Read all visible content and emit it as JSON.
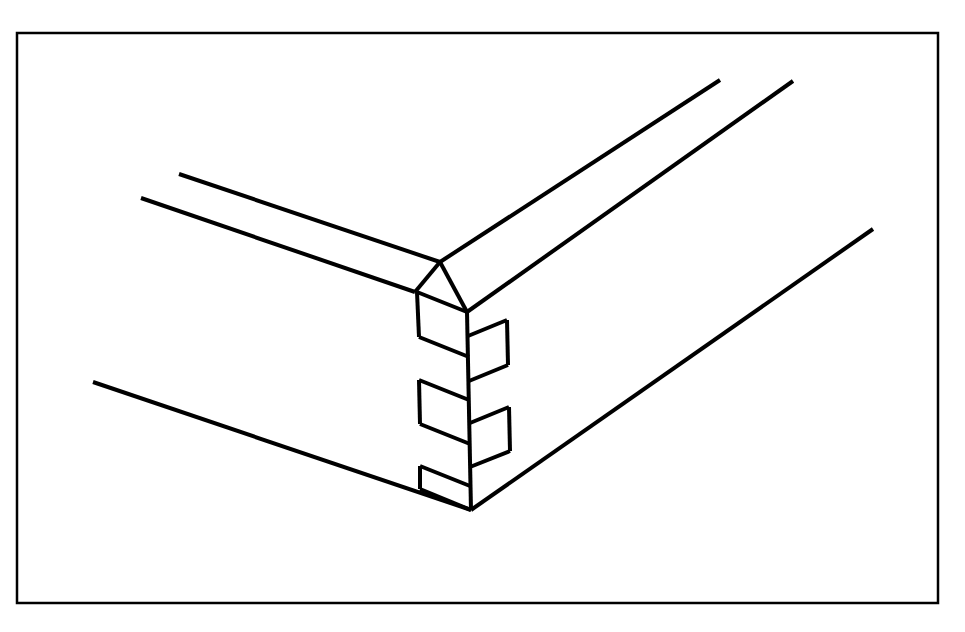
{
  "figure": {
    "projection": "isometric",
    "background_color": "#ffffff",
    "ink_color": "#000000",
    "canvas": {
      "width": 965,
      "height": 632
    }
  },
  "frame": {
    "name": "drawing-border",
    "x": 17,
    "y": 33,
    "width": 921,
    "height": 570,
    "stroke_width": 2.5,
    "color": "#000000"
  },
  "style": {
    "line_width_main": 4.0,
    "line_width_thin": 3.0,
    "color": "#000000"
  },
  "geometry": {
    "front_top_vertex": {
      "x": 467,
      "y": 312
    },
    "front_bottom_vertex": {
      "x": 471,
      "y": 510
    },
    "left_arm_back_top": {
      "x": 415,
      "y": 292
    },
    "left_face_x": 417,
    "right_finger_tip_x": 507,
    "finger_count": 6,
    "left_fingers": 3,
    "right_fingers": 3
  },
  "paths": {
    "left_arm_upper_edge": "M 179 174 L 440 262",
    "left_arm_lower_edge": "M 141 198 L 415 292",
    "left_arm_front_short": "M 440 262 L 467 312",
    "left_arm_corner_short": "M 415 292 L 440 262",
    "right_arm_upper_edge": "M 440 262 L 720 80",
    "right_arm_mid_edge": "M 467 312 L 793 81",
    "right_arm_lower_edge": "M 471 510 L 873 229",
    "bottom_left_edge": "M 93 382 L 471 510",
    "center_vertical": "M 467 312 L 471 510",
    "left_column_vertical": "M 417 292 L 420 489",
    "right_column_vertical": "M 507 330 L 510 475",
    "finger_left_1_top": "M 417 292 L 467 312",
    "finger_left_1_bottom": "M 419 337 L 469 357",
    "finger_left_2_top": "M 419 380 L 469 400",
    "finger_left_2_bottom": "M 420 424 L 470 444",
    "finger_left_3_top": "M 420 466 L 470 486",
    "finger_left_3_bottom": "M 420 489 L 471 510",
    "finger_right_1_top": "M 468 336 L 507 320",
    "finger_right_1_bottom": "M 469 381 L 508 365",
    "finger_right_2_top": "M 470 423 L 509 407",
    "finger_right_2_bottom": "M 470 467 L 510 451",
    "step_left_v_1": "M 417 292 L 419 337",
    "step_left_v_2": "M 419 380 L 420 424",
    "step_left_v_3": "M 420 466 L 420 489",
    "step_right_v_1": "M 507 320 L 508 365",
    "step_right_v_2": "M 509 407 L 510 451"
  },
  "labels": {
    "no_text_present": "This drawing contains no visible text, labels, numbers, or annotations."
  }
}
